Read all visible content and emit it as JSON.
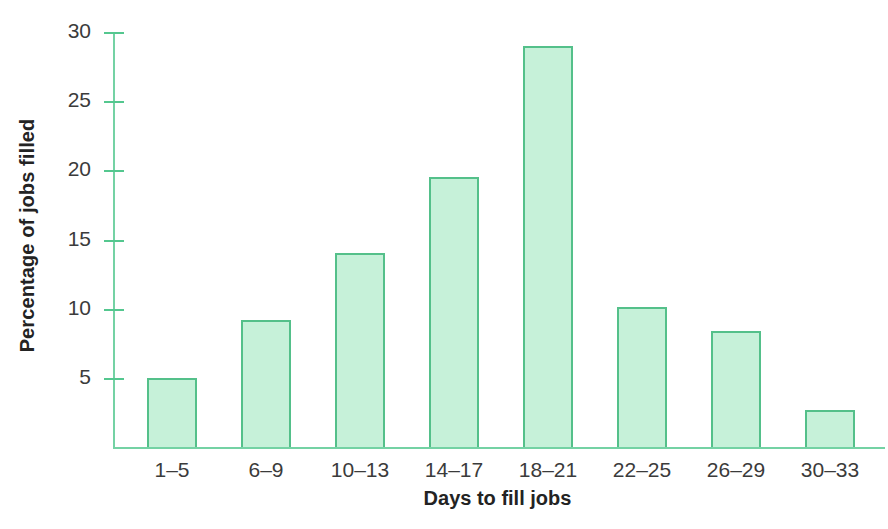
{
  "chart_data": {
    "type": "bar",
    "title": "",
    "xlabel": "Days to fill jobs",
    "ylabel": "Percentage of jobs filled",
    "categories": [
      "1–5",
      "6–9",
      "10–13",
      "14–17",
      "18–21",
      "22–25",
      "26–29",
      "30–33"
    ],
    "values": [
      5.0,
      9.2,
      14.0,
      19.5,
      29.0,
      10.1,
      8.4,
      2.7
    ],
    "ylim": [
      0,
      30
    ],
    "yticks": [
      5,
      10,
      15,
      20,
      25,
      30
    ],
    "ytick_labels": [
      "5",
      "10",
      "15",
      "20",
      "25",
      "30"
    ],
    "grid": false,
    "legend": null,
    "bar_fill_color": "#c6f1d9",
    "bar_border_color": "#54c08a",
    "axis_color": "#74d2a4",
    "text_color": "#3b3b3b"
  }
}
